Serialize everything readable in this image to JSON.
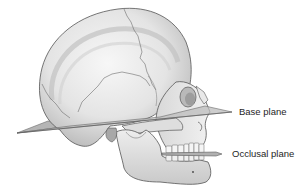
{
  "figure": {
    "labels": {
      "base_plane": "Base plane",
      "occlusal_plane": "Occlusal plane"
    },
    "colors": {
      "background": "#ffffff",
      "bone_light": "#f2f2f2",
      "bone_mid": "#d4d4d4",
      "bone_shadow": "#9a9a9a",
      "outline": "#555555",
      "plane_fill": "#b8b8b8",
      "plane_edge": "#6a6a6a",
      "label_text": "#1e1e1e"
    }
  }
}
